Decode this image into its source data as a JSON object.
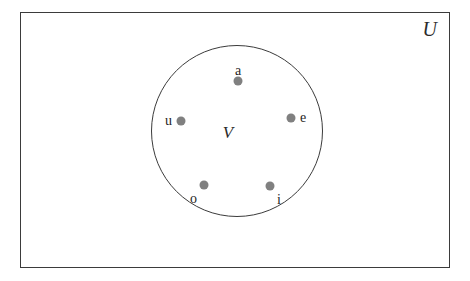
{
  "diagram": {
    "type": "venn",
    "title": "",
    "universal_set": {
      "label": "U",
      "shape": "rectangle"
    },
    "subset": {
      "label": "V",
      "shape": "circle"
    },
    "colors": {
      "outline": "#3b3b3b",
      "dot": "#808080",
      "text": "#1f1f1f",
      "background": "#ffffff"
    },
    "elements": [
      {
        "label": "a",
        "x": 238,
        "y": 81,
        "label_position": "above"
      },
      {
        "label": "u",
        "x": 181,
        "y": 121,
        "label_position": "left"
      },
      {
        "label": "e",
        "x": 291,
        "y": 118,
        "label_position": "right"
      },
      {
        "label": "o",
        "x": 204,
        "y": 185,
        "label_position": "below-left"
      },
      {
        "label": "i",
        "x": 270,
        "y": 186,
        "label_position": "below-right"
      }
    ]
  }
}
